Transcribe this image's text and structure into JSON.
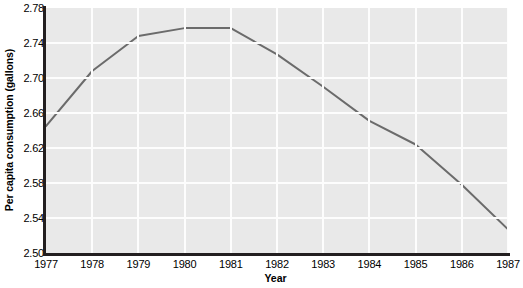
{
  "chart_data": {
    "type": "line",
    "title": "",
    "xlabel": "Year",
    "ylabel": "Per capita consumption (gallons)",
    "x": [
      1977,
      1978,
      1979,
      1980,
      1981,
      1982,
      1983,
      1984,
      1985,
      1986,
      1987
    ],
    "values": [
      2.645,
      2.708,
      2.748,
      2.757,
      2.757,
      2.727,
      2.69,
      2.651,
      2.624,
      2.578,
      2.527
    ],
    "categories": [
      "1977",
      "1978",
      "1979",
      "1980",
      "1981",
      "1982",
      "1983",
      "1984",
      "1985",
      "1986",
      "1987"
    ],
    "xtick_labels": [
      "1977",
      "1978",
      "1979",
      "1980",
      "1981",
      "1982",
      "1983",
      "1984",
      "1985",
      "1986",
      "1987"
    ],
    "ytick_labels": [
      "2.78",
      "2.74",
      "2.70",
      "2.66",
      "2.62",
      "2.58",
      "2.54",
      "2.50"
    ],
    "ytick_values": [
      2.78,
      2.74,
      2.7,
      2.66,
      2.62,
      2.58,
      2.54,
      2.5
    ],
    "ylim": [
      2.5,
      2.78
    ],
    "xlim": [
      1977,
      1987
    ],
    "grid": true,
    "legend": "none",
    "series": [
      {
        "name": "Per capita consumption",
        "values": [
          2.645,
          2.708,
          2.748,
          2.757,
          2.757,
          2.727,
          2.69,
          2.651,
          2.624,
          2.578,
          2.527
        ]
      }
    ],
    "line_color": "#6b6b6b",
    "plot_background": "#e9e9e9",
    "gridline_color": "#fdfdfd",
    "axis_color": "#231f20"
  }
}
